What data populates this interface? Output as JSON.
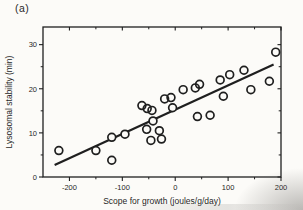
{
  "figure": {
    "panel_label": "(a)"
  },
  "chart_data": {
    "type": "scatter",
    "title": "(a)",
    "xlabel": "Scope for growth (joules/g/day)",
    "ylabel": "Lysosomal stability (min)",
    "xlim": [
      -250,
      200
    ],
    "ylim": [
      0,
      34
    ],
    "xticks": [
      -200,
      -100,
      0,
      100,
      200
    ],
    "yticks": [
      0,
      10,
      20,
      30
    ],
    "xticks_minor": [
      -150,
      -50,
      50,
      150
    ],
    "yticks_minor": [
      5,
      15,
      25
    ],
    "grid": false,
    "legend": "none",
    "marker": "open-circle",
    "ink_color": "#1f1f1f",
    "background_color": "#fcfbf8",
    "points": [
      [
        -220,
        6.0
      ],
      [
        -150,
        6.0
      ],
      [
        -120,
        9.0
      ],
      [
        -120,
        3.8
      ],
      [
        -95,
        9.7
      ],
      [
        -63,
        16.2
      ],
      [
        -53,
        15.5
      ],
      [
        -44,
        15.1
      ],
      [
        -42,
        12.7
      ],
      [
        -54,
        10.8
      ],
      [
        -30,
        10.5
      ],
      [
        -46,
        8.3
      ],
      [
        -26,
        8.6
      ],
      [
        -20,
        17.7
      ],
      [
        -8,
        18.0
      ],
      [
        -5,
        15.7
      ],
      [
        15,
        19.8
      ],
      [
        38,
        20.2
      ],
      [
        46,
        21.0
      ],
      [
        42,
        13.7
      ],
      [
        66,
        14.0
      ],
      [
        85,
        22.0
      ],
      [
        91,
        18.3
      ],
      [
        103,
        23.2
      ],
      [
        130,
        24.2
      ],
      [
        143,
        19.8
      ],
      [
        178,
        21.7
      ],
      [
        190,
        28.3
      ]
    ],
    "trend_line": {
      "x1": -228,
      "y1": 2.7,
      "x2": 186,
      "y2": 25.5
    }
  }
}
